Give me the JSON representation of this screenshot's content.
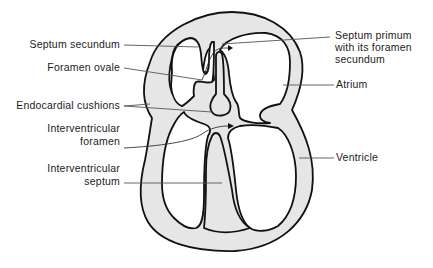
{
  "figure": {
    "colors": {
      "wall_fill": "#e6e6e6",
      "outline": "#111111",
      "leader_line": "#555555",
      "background": "#ffffff"
    },
    "labels_left": [
      {
        "id": "septum-secundum",
        "text": [
          "Septum secundum"
        ]
      },
      {
        "id": "foramen-ovale",
        "text": [
          "Foramen ovale"
        ]
      },
      {
        "id": "endocardial-cushions",
        "text": [
          "Endocardial cushions"
        ]
      },
      {
        "id": "interventricular-foramen",
        "text": [
          "Interventricular",
          "foramen"
        ]
      },
      {
        "id": "interventricular-septum",
        "text": [
          "Interventricular",
          "septum"
        ]
      }
    ],
    "labels_right": [
      {
        "id": "septum-primum",
        "text": [
          "Septum primum",
          "with its foramen",
          "secundum"
        ]
      },
      {
        "id": "atrium",
        "text": [
          "Atrium"
        ]
      },
      {
        "id": "ventricle",
        "text": [
          "Ventricle"
        ]
      }
    ]
  }
}
